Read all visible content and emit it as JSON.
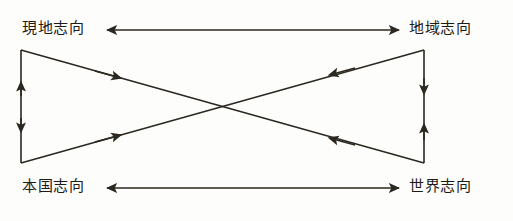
{
  "diagram": {
    "type": "orientation-model",
    "background_color": "#fdfdfb",
    "line_color": "#2b2721",
    "text_color": "#1d1b17",
    "nodes": [
      {
        "id": "top_left",
        "label": "現地志向",
        "position": "top-left"
      },
      {
        "id": "top_right",
        "label": "地域志向",
        "position": "top-right"
      },
      {
        "id": "bottom_left",
        "label": "本国志向",
        "position": "bottom-left"
      },
      {
        "id": "bottom_right",
        "label": "世界志向",
        "position": "bottom-right"
      }
    ],
    "connectors": [
      {
        "id": "top_horizontal",
        "from": "top_left",
        "to": "top_right",
        "arrows": "double"
      },
      {
        "id": "bottom_horizontal",
        "from": "bottom_left",
        "to": "bottom_right",
        "arrows": "double"
      },
      {
        "id": "left_vertical",
        "from": "top_left",
        "to": "bottom_left",
        "arrows": "double"
      },
      {
        "id": "right_vertical",
        "from": "top_right",
        "to": "bottom_right",
        "arrows": "double"
      },
      {
        "id": "diagonal_tl_br",
        "from": "top_left",
        "to": "bottom_right",
        "arrows": "double"
      },
      {
        "id": "diagonal_bl_tr",
        "from": "bottom_left",
        "to": "top_right",
        "arrows": "double"
      }
    ]
  }
}
